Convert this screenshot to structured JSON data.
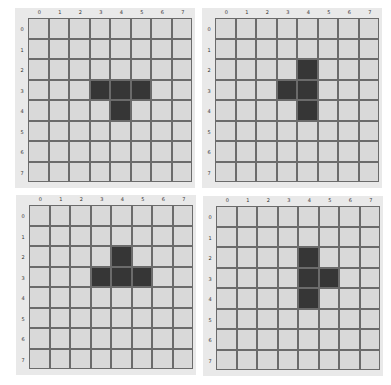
{
  "grid_size": 8,
  "column_labels": [
    "0",
    "1",
    "2",
    "3",
    "4",
    "5",
    "6",
    "7"
  ],
  "row_labels": [
    "0",
    "1",
    "2",
    "3",
    "4",
    "5",
    "6",
    "7"
  ],
  "colors": {
    "panel": "#e9e9e9",
    "empty_cell": "#d9d9d9",
    "filled_cell": "#363636",
    "grid_line": "#6b6b6b"
  },
  "panels": [
    {
      "name": "top-left",
      "shape": "T pointing down",
      "filled": [
        [
          3,
          3
        ],
        [
          3,
          4
        ],
        [
          3,
          5
        ],
        [
          4,
          4
        ]
      ]
    },
    {
      "name": "top-right",
      "shape": "T pointing left",
      "filled": [
        [
          2,
          4
        ],
        [
          3,
          3
        ],
        [
          3,
          4
        ],
        [
          4,
          4
        ]
      ]
    },
    {
      "name": "bottom-left",
      "shape": "T pointing up",
      "filled": [
        [
          2,
          4
        ],
        [
          3,
          3
        ],
        [
          3,
          4
        ],
        [
          3,
          5
        ]
      ]
    },
    {
      "name": "bottom-right",
      "shape": "T pointing right",
      "filled": [
        [
          2,
          4
        ],
        [
          3,
          4
        ],
        [
          3,
          5
        ],
        [
          4,
          4
        ]
      ]
    }
  ]
}
